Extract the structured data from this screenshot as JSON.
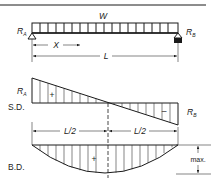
{
  "diagram": {
    "load_label": "W",
    "reaction_left": {
      "symbol": "R",
      "sub": "A"
    },
    "reaction_right": {
      "symbol": "R",
      "sub": "B"
    },
    "distance_x": "X",
    "span_label": "L",
    "shear_diagram_label": "S.D.",
    "moment_diagram_label": "B.D.",
    "half_span_left": "L/2",
    "half_span_right": "L/2",
    "positive_sign": "+",
    "negative_sign": "–",
    "max_label": "max.",
    "colors": {
      "line": "#1a1a1a",
      "background": "#ffffff"
    }
  }
}
